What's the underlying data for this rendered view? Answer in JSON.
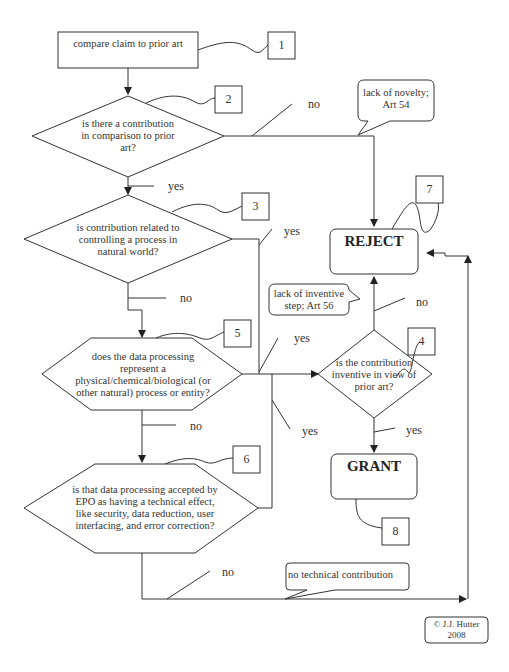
{
  "diagram": {
    "nodes": {
      "start": "compare claim to prior art",
      "q_contribution": "is there a contribution in comparison to prior art?",
      "q_control": "is contribution related to controlling a process in natural world?",
      "q_natural": "does the data processing represent a physical/chemical/biological (or other natural) process or entity?",
      "q_technical": "is that data processing accepted by EPO as having a technical effect, like security, data reduction, user interfacing, and error correction?",
      "q_inventive": "is the contribution inventive in view of prior art?",
      "reject": "REJECT",
      "grant": "GRANT"
    },
    "node_lines": {
      "q_contribution": [
        "is there a contribution",
        "in comparison to prior",
        "art?"
      ],
      "q_control": [
        "is contribution related to",
        "controlling a process in",
        "natural world?"
      ],
      "q_natural": [
        "does the data processing",
        "represent a",
        "physical/chemical/biological (or",
        "other natural) process or entity?"
      ],
      "q_technical": [
        "is that data processing accepted by",
        "EPO as having a technical effect,",
        "like security, data reduction, user",
        "interfacing, and error correction?"
      ],
      "q_inventive": [
        "is the contribution",
        "inventive in view of",
        "prior art?"
      ]
    },
    "callouts": {
      "novelty": [
        "lack of novelty;",
        "Art 54"
      ],
      "inventive_step": [
        "lack of inventive",
        "step; Art 56"
      ],
      "no_technical": "no technical contribution"
    },
    "edge_labels": {
      "q1_no": "no",
      "q1_yes": "yes",
      "q2_yes": "yes",
      "q2_no": "no",
      "q3_yes": "yes",
      "q3_no": "no",
      "q4_yes": "yes",
      "q5_no": "no",
      "q5_yes": "yes",
      "q_inv_no": "no",
      "q_inv_yes": "yes"
    },
    "step_numbers": [
      "1",
      "2",
      "3",
      "4",
      "5",
      "6",
      "7",
      "8"
    ],
    "copyright": [
      "© J.J. Hutter",
      "2008"
    ]
  }
}
